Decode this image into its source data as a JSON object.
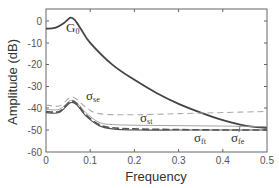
{
  "chart_data": {
    "type": "line",
    "title": "",
    "xlabel": "Frequency",
    "ylabel": "Amplitude (dB)",
    "xlim": [
      0,
      0.5
    ],
    "ylim": [
      -60,
      5.5
    ],
    "xticks": [
      "0",
      "0.1",
      "0.2",
      "0.3",
      "0.4",
      "0.5"
    ],
    "yticks": [
      "0",
      "-10",
      "-20",
      "-30",
      "-40",
      "-50",
      "-60"
    ],
    "grid": false,
    "legend": null,
    "series": [
      {
        "name": "G0",
        "style": "solid-dark-thick",
        "x": [
          0,
          0.02,
          0.04,
          0.055,
          0.065,
          0.08,
          0.1,
          0.15,
          0.2,
          0.25,
          0.3,
          0.35,
          0.4,
          0.45,
          0.5
        ],
        "y": [
          -3.5,
          -3.2,
          -1,
          1.5,
          0.5,
          -4,
          -10,
          -20,
          -27,
          -33,
          -38,
          -42,
          -45.5,
          -48,
          -49
        ]
      },
      {
        "name": "σse",
        "style": "dashed-light",
        "x": [
          0,
          0.03,
          0.055,
          0.07,
          0.09,
          0.12,
          0.2,
          0.3,
          0.4,
          0.5
        ],
        "y": [
          -38.5,
          -39,
          -35,
          -36,
          -39.5,
          -42.5,
          -43,
          -42.5,
          -42,
          -41.5
        ]
      },
      {
        "name": "σst",
        "style": "solid-light",
        "x": [
          0,
          0.03,
          0.055,
          0.07,
          0.09,
          0.12,
          0.15,
          0.2,
          0.3,
          0.4,
          0.5
        ],
        "y": [
          -40.5,
          -40.5,
          -36.5,
          -37.5,
          -42,
          -46.5,
          -47.5,
          -47.8,
          -48,
          -48.2,
          -48.5
        ]
      },
      {
        "name": "σft",
        "style": "solid-dark",
        "x": [
          0,
          0.03,
          0.055,
          0.07,
          0.09,
          0.12,
          0.15,
          0.2,
          0.3,
          0.4,
          0.5
        ],
        "y": [
          -42,
          -42,
          -37.5,
          -38.5,
          -43.5,
          -48,
          -49.5,
          -50,
          -50,
          -50,
          -50
        ]
      },
      {
        "name": "σfe",
        "style": "dashed-dark",
        "x": [
          0,
          0.03,
          0.055,
          0.07,
          0.09,
          0.12,
          0.15,
          0.2,
          0.3,
          0.4,
          0.5
        ],
        "y": [
          -41.5,
          -41.5,
          -37,
          -38,
          -43,
          -47.5,
          -49,
          -49.5,
          -49.8,
          -50,
          -50
        ]
      }
    ],
    "annotations": [
      {
        "text": "G0",
        "x": 0.06,
        "y": -3
      },
      {
        "text": "σse",
        "x": 0.08,
        "y": -32
      },
      {
        "text": "σst",
        "x": 0.22,
        "y": -44
      },
      {
        "text": "σft",
        "x": 0.34,
        "y": -54
      },
      {
        "text": "σfe",
        "x": 0.42,
        "y": -54
      }
    ]
  },
  "labels": {
    "xlabel": "Frequency",
    "ylabel": "Amplitude (dB)",
    "xticks": [
      "0",
      "0.1",
      "0.2",
      "0.3",
      "0.4",
      "0.5"
    ],
    "yticks": [
      "0",
      "-10",
      "-20",
      "-30",
      "-40",
      "-50",
      "-60"
    ],
    "ann_g": "G",
    "ann_g_sub": "0",
    "ann_se": "σ",
    "ann_se_sub": "se",
    "ann_st": "σ",
    "ann_st_sub": "st",
    "ann_ft": "σ",
    "ann_ft_sub": "ft",
    "ann_fe": "σ",
    "ann_fe_sub": "fe"
  }
}
